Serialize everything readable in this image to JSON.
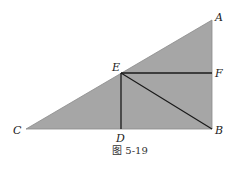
{
  "figure": {
    "caption": "图 5-19",
    "fill_color": "#a6a6a6",
    "line_color": "#1a1a1a",
    "points": {
      "A": {
        "label": "A",
        "x": 212,
        "y": 20
      },
      "B": {
        "label": "B",
        "x": 212,
        "y": 129
      },
      "C": {
        "label": "C",
        "x": 26,
        "y": 129
      },
      "D": {
        "label": "D",
        "x": 121,
        "y": 129
      },
      "E": {
        "label": "E",
        "x": 121,
        "y": 73
      },
      "F": {
        "label": "F",
        "x": 212,
        "y": 73
      }
    },
    "shapes": {
      "triangle": "ABC (right angle at B), shaded",
      "segments": [
        "ED",
        "EF",
        "EB"
      ]
    }
  }
}
